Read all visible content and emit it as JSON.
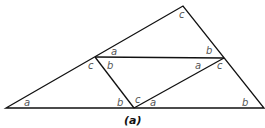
{
  "figure": {
    "caption": "(a)",
    "angle_labels": {
      "top": "c",
      "upper_left_mid_a": "a",
      "upper_right_b": "b",
      "left_mid_c": "c",
      "left_mid_b": "b",
      "right_mid_a": "a",
      "right_mid_c": "c",
      "bottom_left_a": "a",
      "bottom_mid_b": "b",
      "bottom_mid_c": "c",
      "bottom_mid_a": "a",
      "bottom_right_b": "b"
    },
    "colors": {
      "line": "#111111",
      "label": "#555555"
    }
  }
}
